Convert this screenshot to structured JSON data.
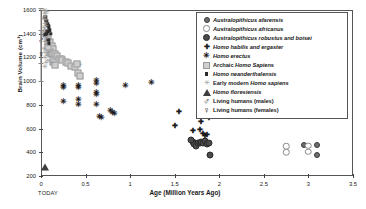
{
  "chart_data": {
    "type": "scatter",
    "title": "",
    "xlabel": "Age (Million Years Ago)",
    "ylabel": "Brain Volume (cm³)",
    "xlim": [
      0,
      3.5
    ],
    "ylim": [
      200,
      1600
    ],
    "xticks": [
      "0",
      "0.5",
      "1",
      "1.5",
      "2",
      "2.5",
      "3",
      "3.5"
    ],
    "yticks": [
      "200",
      "400",
      "600",
      "800",
      "1000",
      "1200",
      "1400",
      "1600"
    ],
    "origin_note": "TODAY",
    "grid": false,
    "legend_position": "top-right",
    "series": [
      {
        "name": "Australopithicus afarensis",
        "marker": "filled-gray-circle",
        "color": "#6e6e6e",
        "points": [
          [
            2.95,
            465
          ],
          [
            3.1,
            460
          ],
          [
            3.1,
            380
          ],
          [
            1.78,
            800
          ]
        ]
      },
      {
        "name": "Australopithicus africanus",
        "marker": "open-circle",
        "color": "#8a8a8a",
        "points": [
          [
            2.75,
            450
          ],
          [
            2.75,
            400
          ],
          [
            3.0,
            455
          ],
          [
            3.0,
            405
          ]
        ]
      },
      {
        "name": "Australopithicus robustus and boisei",
        "marker": "filled-dark-circle",
        "color": "#4a4a4a",
        "points": [
          [
            1.7,
            490
          ],
          [
            1.72,
            470
          ],
          [
            1.74,
            455
          ],
          [
            1.76,
            480
          ],
          [
            1.78,
            475
          ],
          [
            1.8,
            490
          ],
          [
            1.82,
            480
          ],
          [
            1.84,
            495
          ],
          [
            1.86,
            470
          ],
          [
            1.88,
            480
          ],
          [
            1.9,
            380
          ],
          [
            1.68,
            500
          ]
        ]
      },
      {
        "name": "Homo habilis and ergaster",
        "marker": "plus",
        "color": "#1a1a1a",
        "points": [
          [
            1.5,
            630
          ],
          [
            1.55,
            750
          ],
          [
            1.78,
            800
          ],
          [
            1.8,
            660
          ],
          [
            1.78,
            600
          ],
          [
            1.88,
            700
          ],
          [
            1.82,
            560
          ],
          [
            1.84,
            545
          ],
          [
            1.86,
            555
          ],
          [
            1.7,
            590
          ]
        ]
      },
      {
        "name": "Homo erectus",
        "marker": "asterisk",
        "color": "#1a1a1a",
        "points": [
          [
            0.25,
            960
          ],
          [
            0.25,
            940
          ],
          [
            0.25,
            820
          ],
          [
            0.42,
            1140
          ],
          [
            0.42,
            960
          ],
          [
            0.42,
            945
          ],
          [
            0.42,
            845
          ],
          [
            0.42,
            800
          ],
          [
            0.62,
            1000
          ],
          [
            0.62,
            980
          ],
          [
            0.62,
            900
          ],
          [
            0.62,
            880
          ],
          [
            0.62,
            800
          ],
          [
            0.66,
            700
          ],
          [
            0.68,
            690
          ],
          [
            0.78,
            750
          ],
          [
            0.8,
            735
          ],
          [
            0.82,
            725
          ],
          [
            0.95,
            955
          ],
          [
            1.24,
            985
          ]
        ]
      },
      {
        "name": "Archaic Homo Sapiens",
        "marker": "light-gray-square",
        "color": "#cfcfcf",
        "points": [
          [
            0.06,
            1400
          ],
          [
            0.08,
            1355
          ],
          [
            0.1,
            1330
          ],
          [
            0.12,
            1300
          ],
          [
            0.14,
            1270
          ],
          [
            0.1,
            1250
          ],
          [
            0.12,
            1230
          ],
          [
            0.16,
            1230
          ],
          [
            0.18,
            1215
          ],
          [
            0.2,
            1190
          ],
          [
            0.22,
            1185
          ],
          [
            0.24,
            1175
          ],
          [
            0.28,
            1160
          ],
          [
            0.3,
            1150
          ],
          [
            0.34,
            1130
          ],
          [
            0.38,
            1120
          ],
          [
            0.4,
            1145
          ],
          [
            0.42,
            1070
          ],
          [
            0.44,
            1045
          ],
          [
            0.14,
            1165
          ],
          [
            0.16,
            1140
          ],
          [
            0.08,
            1290
          ]
        ]
      },
      {
        "name": "Homo neanderthalensis",
        "marker": "dark-square",
        "color": "#2b2b2b",
        "points": [
          [
            0.05,
            1540
          ],
          [
            0.06,
            1510
          ],
          [
            0.07,
            1480
          ],
          [
            0.08,
            1465
          ],
          [
            0.09,
            1450
          ],
          [
            0.1,
            1430
          ],
          [
            0.07,
            1420
          ],
          [
            0.06,
            1400
          ],
          [
            0.05,
            1390
          ],
          [
            0.11,
            1400
          ],
          [
            0.08,
            1350
          ],
          [
            0.09,
            1320
          ]
        ]
      },
      {
        "name": "Early modern Homo sapiens",
        "marker": "gray-asterisk",
        "color": "#9a9a9a",
        "points": [
          [
            0.03,
            1600
          ],
          [
            0.04,
            1575
          ],
          [
            0.05,
            1550
          ],
          [
            0.05,
            1600
          ],
          [
            0.06,
            1520
          ],
          [
            0.04,
            1490
          ],
          [
            0.03,
            1460
          ],
          [
            0.05,
            1440
          ],
          [
            0.06,
            1470
          ],
          [
            0.07,
            1370
          ],
          [
            0.04,
            1340
          ],
          [
            0.06,
            1310
          ],
          [
            0.03,
            1280
          ],
          [
            0.05,
            1250
          ],
          [
            0.07,
            1220
          ],
          [
            0.04,
            1200
          ],
          [
            0.08,
            1180
          ],
          [
            0.06,
            1160
          ],
          [
            0.05,
            1130
          ],
          [
            0.09,
            1250
          ],
          [
            0.1,
            1210
          ],
          [
            0.12,
            1160
          ],
          [
            0.02,
            1530
          ],
          [
            0.07,
            1590
          ]
        ]
      },
      {
        "name": "Homo floresiensis",
        "marker": "triangle",
        "color": "#3d3d3d",
        "points": [
          [
            0.05,
            280
          ]
        ]
      },
      {
        "name": "Living humans (males)",
        "marker": "mars-symbol",
        "color": "#111111",
        "points": [
          [
            0.0,
            1350
          ]
        ],
        "error_bar": {
          "x": 0.0,
          "low": 1150,
          "high": 1620
        }
      },
      {
        "name": "Living humans (females)",
        "marker": "venus-symbol",
        "color": "#111111",
        "points": [
          [
            0.0,
            1230
          ]
        ],
        "error_bar": {
          "x": 0.0,
          "low": 1000,
          "high": 1430
        }
      }
    ]
  },
  "legend": {
    "items": [
      {
        "label": "Australopithicus afarensis",
        "style": "italic",
        "symbol": "afarensis-marker"
      },
      {
        "label": "Australopithicus africanus",
        "style": "italic",
        "symbol": "africanus-marker"
      },
      {
        "label": "Australopithicus robustus and boisei",
        "style": "italic",
        "symbol": "robustus-marker"
      },
      {
        "label": "Homo habilis and ergaster",
        "style": "italic",
        "symbol": "habilis-marker"
      },
      {
        "label": "Homo erectus",
        "style": "italic",
        "symbol": "erectus-marker"
      },
      {
        "label": "Archaic Homo Sapiens",
        "style": "mixed",
        "symbol": "archaic-marker"
      },
      {
        "label": "Homo neanderthalensis",
        "style": "italic",
        "symbol": "neanderthalensis-marker"
      },
      {
        "label": "Early modern Homo sapiens",
        "style": "mixed",
        "symbol": "early-modern-marker"
      },
      {
        "label": "Homo floresiensis",
        "style": "italic",
        "symbol": "floresiensis-marker"
      },
      {
        "label": "Living humans (males)",
        "style": "normal",
        "symbol": "male-marker"
      },
      {
        "label": "Living humans (females)",
        "style": "normal",
        "symbol": "female-marker"
      }
    ]
  }
}
